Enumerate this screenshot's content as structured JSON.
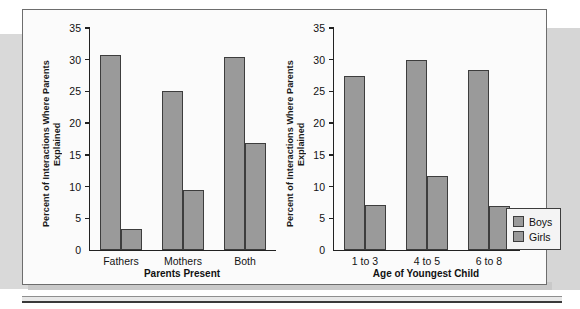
{
  "figure": {
    "background_color": "#fbfbfb",
    "border_color": "#6d6d6d",
    "bar_color": "#9a9a9a",
    "bar_outline_color": "#3d3d3d"
  },
  "legend": {
    "entries": [
      {
        "label": "Boys",
        "color": "#9a9a9a"
      },
      {
        "label": "Girls",
        "color": "#9a9a9a"
      }
    ]
  },
  "chart_data": [
    {
      "type": "bar",
      "title": "",
      "xlabel": "Parents Present",
      "ylabel": "Percent of Interactions Where Parents Explained",
      "categories": [
        "Fathers",
        "Mothers",
        "Both"
      ],
      "series": [
        {
          "name": "Boys",
          "values": [
            30.7,
            25.0,
            30.4
          ]
        },
        {
          "name": "Girls",
          "values": [
            3.3,
            9.4,
            16.8
          ]
        }
      ],
      "ylim": [
        0,
        35
      ],
      "yticks": [
        0,
        5,
        10,
        15,
        20,
        25,
        30,
        35
      ],
      "ytick_labels": [
        "0",
        "5",
        "10",
        "15",
        "20",
        "25",
        "30",
        "35"
      ],
      "grid": false,
      "legend_position": "none"
    },
    {
      "type": "bar",
      "title": "",
      "xlabel": "Age of Youngest Child",
      "ylabel": "Percent of Interactions Where Parents Explained",
      "categories": [
        "1 to 3",
        "4 to 5",
        "6 to 8"
      ],
      "series": [
        {
          "name": "Boys",
          "values": [
            27.4,
            29.9,
            28.4
          ]
        },
        {
          "name": "Girls",
          "values": [
            7.1,
            11.7,
            6.9
          ]
        }
      ],
      "ylim": [
        0,
        35
      ],
      "yticks": [
        0,
        5,
        10,
        15,
        20,
        25,
        30,
        35
      ],
      "ytick_labels": [
        "0",
        "5",
        "10",
        "15",
        "20",
        "25",
        "30",
        "35"
      ],
      "grid": false,
      "legend_position": "right"
    }
  ]
}
